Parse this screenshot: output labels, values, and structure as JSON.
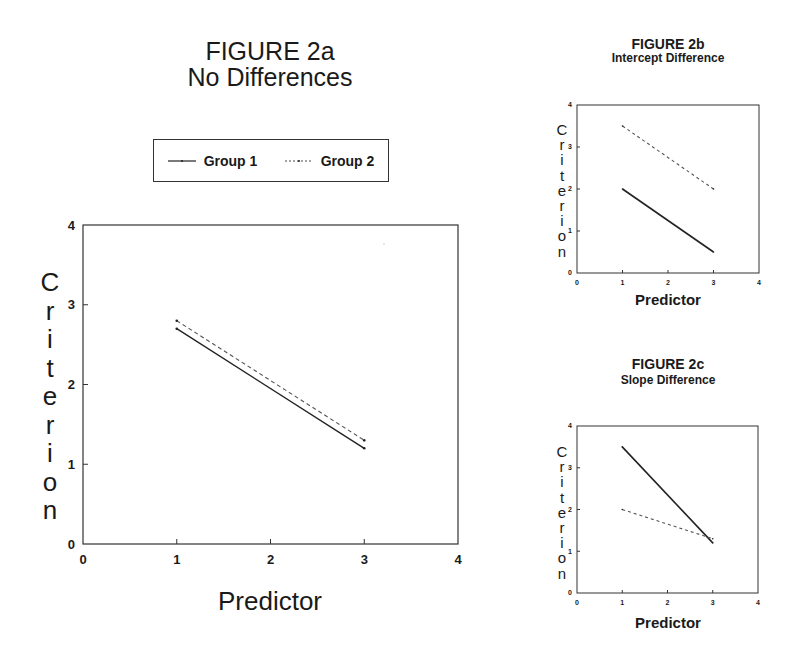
{
  "figures": {
    "a": {
      "title": "FIGURE 2a",
      "subtitle": "No Differences",
      "ylabel": "Criterion",
      "xlabel": "Predictor",
      "legend": [
        {
          "label": "Group 1",
          "style": "solid"
        },
        {
          "label": "Group 2",
          "style": "dashed"
        }
      ]
    },
    "b": {
      "title": "FIGURE 2b",
      "subtitle": "Intercept Difference",
      "ylabel": "Criterion",
      "xlabel": "Predictor"
    },
    "c": {
      "title": "FIGURE 2c",
      "subtitle": "Slope Difference",
      "ylabel": "Criterion",
      "xlabel": "Predictor"
    }
  },
  "chart_data": [
    {
      "type": "line",
      "title": "FIGURE 2a No Differences",
      "xlabel": "Predictor",
      "ylabel": "Criterion",
      "xlim": [
        0,
        4
      ],
      "ylim": [
        0,
        4
      ],
      "xticks": [
        0,
        1,
        2,
        3,
        4
      ],
      "yticks": [
        0,
        1,
        2,
        3,
        4
      ],
      "grid": false,
      "legend_position": "top (above plot)",
      "x": [
        1,
        3
      ],
      "series": [
        {
          "name": "Group 1",
          "style": "solid",
          "values": [
            2.7,
            1.2
          ]
        },
        {
          "name": "Group 2",
          "style": "dashed",
          "values": [
            2.8,
            1.3
          ]
        }
      ]
    },
    {
      "type": "line",
      "title": "FIGURE 2b Intercept Difference",
      "xlabel": "Predictor",
      "ylabel": "Criterion",
      "xlim": [
        0,
        4
      ],
      "ylim": [
        0,
        4
      ],
      "xticks": [
        0,
        1,
        2,
        3,
        4
      ],
      "yticks": [
        0,
        1,
        2,
        3,
        4
      ],
      "grid": false,
      "x": [
        1,
        3
      ],
      "series": [
        {
          "name": "Group 1",
          "style": "solid",
          "values": [
            2.0,
            0.5
          ]
        },
        {
          "name": "Group 2",
          "style": "dashed",
          "values": [
            3.5,
            2.0
          ]
        }
      ]
    },
    {
      "type": "line",
      "title": "FIGURE 2c Slope Difference",
      "xlabel": "Predictor",
      "ylabel": "Criterion",
      "xlim": [
        0,
        4
      ],
      "ylim": [
        0,
        4
      ],
      "xticks": [
        0,
        1,
        2,
        3,
        4
      ],
      "yticks": [
        0,
        1,
        2,
        3,
        4
      ],
      "grid": false,
      "x": [
        1,
        3
      ],
      "series": [
        {
          "name": "Group 1",
          "style": "solid",
          "values": [
            3.5,
            1.2
          ]
        },
        {
          "name": "Group 2",
          "style": "dashed",
          "values": [
            2.0,
            1.3
          ]
        }
      ]
    }
  ]
}
